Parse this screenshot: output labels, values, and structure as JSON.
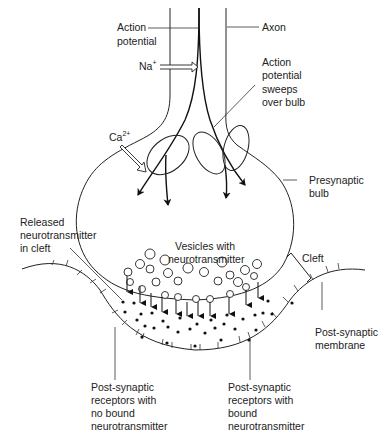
{
  "diagram": {
    "labels": {
      "action_potential": [
        "Action",
        "potential"
      ],
      "axon": "Axon",
      "sodium": "Na",
      "sodium_charge": "+",
      "calcium": "Ca",
      "calcium_charge": "2+",
      "sweeps": [
        "Action",
        "potential",
        "sweeps",
        "over bulb"
      ],
      "presynaptic": [
        "Presynaptic",
        "bulb"
      ],
      "released": [
        "Released",
        "neurotransmitter",
        "in cleft"
      ],
      "vesicles": [
        "Vesicles with",
        "neurotransmitter"
      ],
      "cleft": "Cleft",
      "postsynaptic_membrane": [
        "Post-synaptic",
        "membrane"
      ],
      "receptors_unbound": [
        "Post-synaptic",
        "receptors with",
        "no bound",
        "neurotransmitter"
      ],
      "receptors_bound": [
        "Post-synaptic",
        "receptors with",
        "bound",
        "neurotransmitter"
      ]
    },
    "colors": {
      "line": "#222222",
      "background": "#ffffff"
    }
  }
}
